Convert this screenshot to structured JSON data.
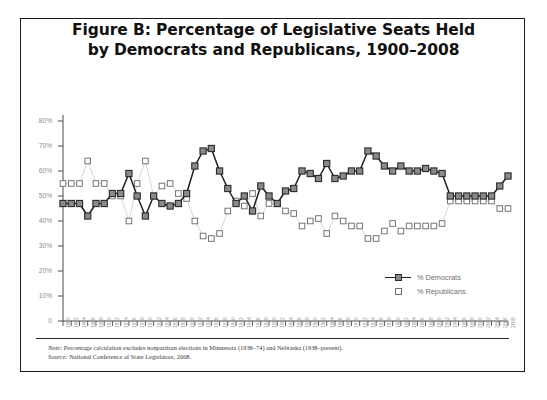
{
  "figure": {
    "title_line1": "Figure B: Percentage of Legislative Seats Held",
    "title_line2": "by Democrats and Republicans, 1900–2008",
    "note_label": "Note:",
    "note_text": " Percentage calculation excludes nonpartisan elections in Minnesota (1938–74) and Nebraska (1938–present).",
    "source_label": "Source:",
    "source_text": " National Conference of State Legislators, 2008."
  },
  "legend": {
    "position": "inside-bottom-right",
    "items": [
      {
        "label": "% Democrats",
        "key": "filled-square-with-line",
        "color": "#8a8a8a"
      },
      {
        "label": "% Republicans",
        "key": "open-square",
        "color": "#ffffff"
      }
    ]
  },
  "colors": {
    "democrat_fill": "#8a8a8a",
    "democrat_edge": "#2b2b2b",
    "democrat_line": "#1e1e1e",
    "republican_fill": "#ffffff",
    "republican_edge": "#6e6e6e",
    "republican_line": "#d8d8d8",
    "axis": "#4a4a4a",
    "tick_label": "#8d8d8d",
    "frame": "#1a1a1a"
  },
  "chart_data": {
    "type": "line",
    "title": "Figure B: Percentage of Legislative Seats Held by Democrats and Republicans, 1900–2008",
    "xlabel": "",
    "ylabel": "",
    "ylim": [
      0,
      80
    ],
    "ytick_labels": [
      "0",
      "10%",
      "20%",
      "30%",
      "40%",
      "50%",
      "60%",
      "70%",
      "80%"
    ],
    "ytick_values": [
      0,
      10,
      20,
      30,
      40,
      50,
      60,
      70,
      80
    ],
    "grid": false,
    "legend_position": "lower right",
    "x": [
      1900,
      1902,
      1904,
      1906,
      1908,
      1910,
      1912,
      1914,
      1916,
      1918,
      1920,
      1922,
      1924,
      1926,
      1928,
      1930,
      1932,
      1934,
      1936,
      1938,
      1940,
      1942,
      1944,
      1946,
      1948,
      1950,
      1952,
      1954,
      1956,
      1958,
      1960,
      1962,
      1964,
      1966,
      1968,
      1970,
      1972,
      1974,
      1976,
      1978,
      1980,
      1982,
      1984,
      1986,
      1988,
      1990,
      1992,
      1994,
      1996,
      1998,
      2000,
      2002,
      2004,
      2006,
      2008
    ],
    "categories": [
      "1900",
      "1902",
      "1904",
      "1906",
      "1908",
      "1910",
      "1912",
      "1914",
      "1916",
      "1918",
      "1920",
      "1922",
      "1924",
      "1926",
      "1928",
      "1930",
      "1932",
      "1934",
      "1936",
      "1938",
      "1940",
      "1942",
      "1944",
      "1946",
      "1948",
      "1950",
      "1952",
      "1954",
      "1956",
      "1958",
      "1960",
      "1962",
      "1964",
      "1966",
      "1968",
      "1970",
      "1972",
      "1974",
      "1976",
      "1978",
      "1980",
      "1982",
      "1984",
      "1986",
      "1988",
      "1990",
      "1992",
      "1994",
      "1996",
      "1998",
      "2000",
      "2002",
      "2004",
      "2006",
      "2008"
    ],
    "series": [
      {
        "name": "% Democrats",
        "marker": "filled-square",
        "values": [
          47,
          47,
          47,
          42,
          47,
          47,
          51,
          51,
          59,
          50,
          42,
          50,
          47,
          46,
          47,
          51,
          62,
          68,
          69,
          60,
          53,
          47,
          50,
          44,
          54,
          50,
          47,
          52,
          53,
          60,
          59,
          57,
          63,
          57,
          58,
          60,
          60,
          68,
          66,
          62,
          60,
          62,
          60,
          60,
          61,
          60,
          59,
          50,
          50,
          50,
          50,
          50,
          50,
          54,
          58
        ]
      },
      {
        "name": "% Republicans",
        "marker": "open-square",
        "values": [
          55,
          55,
          55,
          64,
          55,
          55,
          50,
          50,
          40,
          55,
          64,
          50,
          54,
          55,
          51,
          49,
          40,
          34,
          33,
          35,
          44,
          48,
          46,
          51,
          42,
          47,
          47,
          44,
          43,
          38,
          40,
          41,
          35,
          42,
          40,
          38,
          38,
          33,
          33,
          36,
          39,
          36,
          38,
          38,
          38,
          38,
          39,
          48,
          48,
          48,
          48,
          48,
          48,
          45,
          45
        ]
      }
    ]
  }
}
